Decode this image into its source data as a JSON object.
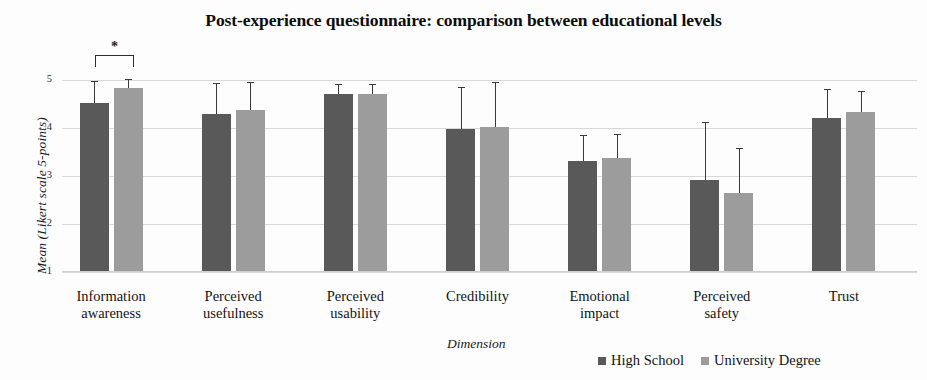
{
  "chart_data": {
    "type": "bar",
    "title": "Post-experience questionnaire: comparison between educational levels",
    "xlabel": "Dimension",
    "ylabel": "Mean (Likert scale 5-points)",
    "ylim": [
      1,
      5
    ],
    "yticks": [
      1,
      2,
      3,
      4,
      5
    ],
    "grid": true,
    "legend_position": "bottom-right",
    "categories": [
      "Information awareness",
      "Perceived usefulness",
      "Perceived usability",
      "Credibility",
      "Emotional impact",
      "Perceived safety",
      "Trust"
    ],
    "category_lines": [
      [
        "Information",
        "awareness"
      ],
      [
        "Perceived",
        "usefulness"
      ],
      [
        "Perceived",
        "usability"
      ],
      [
        "Credibility",
        ""
      ],
      [
        "Emotional",
        "impact"
      ],
      [
        "Perceived",
        "safety"
      ],
      [
        "Trust",
        ""
      ]
    ],
    "series": [
      {
        "name": "High School",
        "color": "#595959",
        "values": [
          4.52,
          4.3,
          4.7,
          3.97,
          3.32,
          2.92,
          4.2
        ],
        "errors_upper": [
          4.98,
          4.94,
          4.92,
          4.86,
          3.85,
          4.12,
          4.82
        ]
      },
      {
        "name": "University Degree",
        "color": "#9c9c9c",
        "values": [
          4.83,
          4.37,
          4.7,
          4.03,
          3.37,
          2.65,
          4.33
        ],
        "errors_upper": [
          5.02,
          4.96,
          4.92,
          4.95,
          3.87,
          3.58,
          4.78
        ]
      }
    ],
    "annotations": [
      {
        "type": "significance-bracket",
        "label": "*",
        "category": "Information awareness",
        "between": [
          "High School",
          "University Degree"
        ]
      }
    ]
  },
  "axis": {
    "yticks": [
      "1",
      "2",
      "3",
      "4",
      "5"
    ]
  },
  "legend": {
    "items": [
      {
        "label": "High School",
        "color": "#595959"
      },
      {
        "label": "University Degree",
        "color": "#9c9c9c"
      }
    ]
  }
}
